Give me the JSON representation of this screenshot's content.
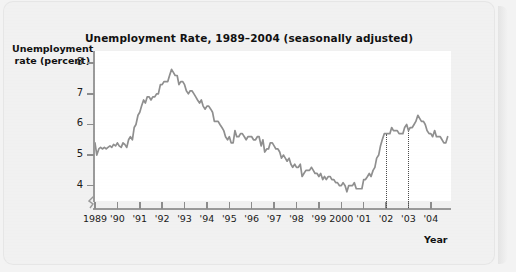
{
  "figure": {
    "title": "Unemployment Rate, 1989–2004 (seasonally adjusted)",
    "y_axis_label_line1": "Unemployment",
    "y_axis_label_line2": "rate (percent)",
    "x_axis_label": "Year",
    "line_color": "#8f8f8f",
    "axis_color": "#9a9a9a",
    "plot_background": "#ffffff",
    "page_background": "#f1f1f1"
  },
  "chart_data": {
    "type": "line",
    "title": "Unemployment Rate, 1989–2004 (seasonally adjusted)",
    "xlabel": "Year",
    "ylabel": "Unemployment rate (percent)",
    "xlim": [
      1989.0,
      2004.9
    ],
    "ylim": [
      3.5,
      8.4
    ],
    "y_axis_break": true,
    "grid": false,
    "legend": null,
    "ytick_labels": [
      "4",
      "5",
      "6",
      "7",
      "8"
    ],
    "ytick_values": [
      4,
      5,
      6,
      7,
      8
    ],
    "xtick_labels": [
      "1989",
      "'90",
      "'91",
      "'92",
      "'93",
      "'94",
      "'95",
      "'96",
      "'97",
      "'98",
      "'99",
      "2000",
      "'01",
      "'02",
      "'03",
      "'04"
    ],
    "xtick_values": [
      1989,
      1990,
      1991,
      1992,
      1993,
      1994,
      1995,
      1996,
      1997,
      1998,
      1999,
      2000,
      2001,
      2002,
      2003,
      2004
    ],
    "annotations": [
      {
        "name": "recession-marker-2002",
        "type": "vertical-dotted-line",
        "x": 2002.0
      },
      {
        "name": "recession-marker-2003",
        "type": "vertical-dotted-line",
        "x": 2003.0
      }
    ],
    "series": [
      {
        "name": "Unemployment rate",
        "color": "#8f8f8f",
        "x": [
          1989.0,
          1989.08,
          1989.17,
          1989.25,
          1989.33,
          1989.42,
          1989.5,
          1989.58,
          1989.67,
          1989.75,
          1989.83,
          1989.92,
          1990.0,
          1990.08,
          1990.17,
          1990.25,
          1990.33,
          1990.42,
          1990.5,
          1990.58,
          1990.67,
          1990.75,
          1990.83,
          1990.92,
          1991.0,
          1991.08,
          1991.17,
          1991.25,
          1991.33,
          1991.42,
          1991.5,
          1991.58,
          1991.67,
          1991.75,
          1991.83,
          1991.92,
          1992.0,
          1992.08,
          1992.17,
          1992.25,
          1992.33,
          1992.42,
          1992.5,
          1992.58,
          1992.67,
          1992.75,
          1992.83,
          1992.92,
          1993.0,
          1993.08,
          1993.17,
          1993.25,
          1993.33,
          1993.42,
          1993.5,
          1993.58,
          1993.67,
          1993.75,
          1993.83,
          1993.92,
          1994.0,
          1994.08,
          1994.17,
          1994.25,
          1994.33,
          1994.42,
          1994.5,
          1994.58,
          1994.67,
          1994.75,
          1994.83,
          1994.92,
          1995.0,
          1995.08,
          1995.17,
          1995.25,
          1995.33,
          1995.42,
          1995.5,
          1995.58,
          1995.67,
          1995.75,
          1995.83,
          1995.92,
          1996.0,
          1996.08,
          1996.17,
          1996.25,
          1996.33,
          1996.42,
          1996.5,
          1996.58,
          1996.67,
          1996.75,
          1996.83,
          1996.92,
          1997.0,
          1997.08,
          1997.17,
          1997.25,
          1997.33,
          1997.42,
          1997.5,
          1997.58,
          1997.67,
          1997.75,
          1997.83,
          1997.92,
          1998.0,
          1998.08,
          1998.17,
          1998.25,
          1998.33,
          1998.42,
          1998.5,
          1998.58,
          1998.67,
          1998.75,
          1998.83,
          1998.92,
          1999.0,
          1999.08,
          1999.17,
          1999.25,
          1999.33,
          1999.42,
          1999.5,
          1999.58,
          1999.67,
          1999.75,
          1999.83,
          1999.92,
          2000.0,
          2000.08,
          2000.17,
          2000.25,
          2000.33,
          2000.42,
          2000.5,
          2000.58,
          2000.67,
          2000.75,
          2000.83,
          2000.92,
          2001.0,
          2001.08,
          2001.17,
          2001.25,
          2001.33,
          2001.42,
          2001.5,
          2001.58,
          2001.67,
          2001.75,
          2001.83,
          2001.92,
          2002.0,
          2002.08,
          2002.17,
          2002.25,
          2002.33,
          2002.42,
          2002.5,
          2002.58,
          2002.67,
          2002.75,
          2002.83,
          2002.92,
          2003.0,
          2003.08,
          2003.17,
          2003.25,
          2003.33,
          2003.42,
          2003.5,
          2003.58,
          2003.67,
          2003.75,
          2003.83,
          2003.92,
          2004.0,
          2004.08,
          2004.17,
          2004.25,
          2004.33,
          2004.42,
          2004.5,
          2004.58,
          2004.67,
          2004.75
        ],
        "y": [
          5.4,
          5.0,
          5.2,
          5.25,
          5.2,
          5.25,
          5.2,
          5.25,
          5.3,
          5.25,
          5.35,
          5.3,
          5.4,
          5.3,
          5.25,
          5.4,
          5.35,
          5.25,
          5.5,
          5.6,
          5.5,
          5.9,
          6.0,
          6.3,
          6.4,
          6.6,
          6.8,
          6.7,
          6.9,
          6.9,
          6.8,
          6.9,
          6.9,
          7.0,
          7.0,
          7.3,
          7.3,
          7.4,
          7.4,
          7.4,
          7.6,
          7.8,
          7.7,
          7.6,
          7.6,
          7.3,
          7.4,
          7.4,
          7.3,
          7.1,
          7.0,
          7.1,
          7.1,
          7.0,
          6.9,
          6.8,
          6.7,
          6.8,
          6.6,
          6.5,
          6.6,
          6.6,
          6.5,
          6.4,
          6.1,
          6.1,
          6.1,
          6.0,
          5.9,
          5.8,
          5.6,
          5.5,
          5.6,
          5.4,
          5.4,
          5.8,
          5.6,
          5.6,
          5.7,
          5.7,
          5.6,
          5.5,
          5.6,
          5.6,
          5.6,
          5.5,
          5.5,
          5.6,
          5.6,
          5.3,
          5.5,
          5.1,
          5.2,
          5.2,
          5.4,
          5.4,
          5.3,
          5.2,
          5.2,
          5.1,
          4.9,
          5.0,
          4.9,
          4.8,
          4.9,
          4.7,
          4.6,
          4.7,
          4.6,
          4.6,
          4.7,
          4.3,
          4.4,
          4.5,
          4.5,
          4.5,
          4.6,
          4.5,
          4.4,
          4.4,
          4.3,
          4.4,
          4.2,
          4.3,
          4.2,
          4.3,
          4.3,
          4.2,
          4.2,
          4.1,
          4.1,
          4.0,
          4.0,
          4.1,
          4.0,
          3.8,
          4.0,
          4.0,
          4.0,
          4.1,
          3.9,
          3.9,
          3.9,
          3.9,
          4.2,
          4.2,
          4.3,
          4.4,
          4.3,
          4.5,
          4.6,
          4.9,
          5.0,
          5.3,
          5.5,
          5.7,
          5.7,
          5.7,
          5.7,
          5.9,
          5.8,
          5.8,
          5.8,
          5.7,
          5.7,
          5.7,
          5.9,
          6.0,
          5.8,
          5.9,
          5.9,
          6.0,
          6.1,
          6.3,
          6.2,
          6.1,
          6.1,
          6.0,
          5.8,
          5.7,
          5.7,
          5.6,
          5.8,
          5.6,
          5.6,
          5.6,
          5.5,
          5.4,
          5.4,
          5.6
        ]
      }
    ]
  }
}
